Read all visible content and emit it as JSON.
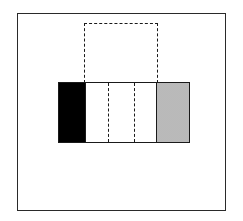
{
  "diagram": {
    "colors": {
      "frame": "#2a2a2a",
      "black_segment": "#000000",
      "gray_segment": "#d4d4d4",
      "background": "#ffffff"
    },
    "bar": {
      "segments": [
        "black",
        "white",
        "white-dashed-divided",
        "white",
        "gray-stippled"
      ],
      "dashed_dividers": 2
    },
    "dashed_box": {
      "position": "above central segments",
      "style": "dashed"
    }
  }
}
